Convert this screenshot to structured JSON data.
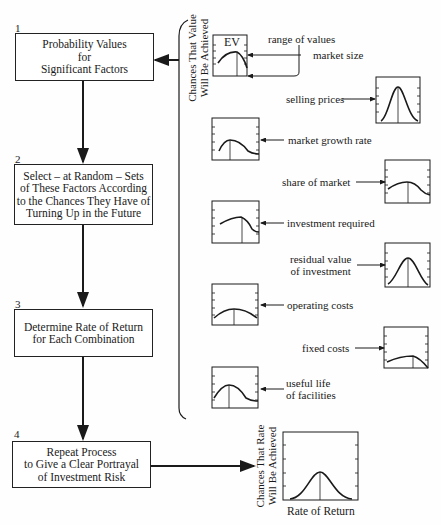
{
  "steps": [
    {
      "number": "1",
      "text": "Probability Values\nfor\nSignificant Factors"
    },
    {
      "number": "2",
      "text": "Select – at Random – Sets\nof These Factors According\nto the Chances They Have of\nTurning Up in the Future"
    },
    {
      "number": "3",
      "text": "Determine Rate of Return\nfor Each Combination"
    },
    {
      "number": "4",
      "text": "Repeat Process\nto Give a Clear Portrayal\nof Investment Risk"
    }
  ],
  "factor_axis_label": "Chances That Value\nWill Be Achieved",
  "ev_label": "EV",
  "range_label": "range of values",
  "factors": [
    {
      "name": "market size",
      "curve": "broad-skewed-right"
    },
    {
      "name": "selling prices",
      "curve": "narrow-normal"
    },
    {
      "name": "market growth rate",
      "curve": "skewed-left-peak"
    },
    {
      "name": "share of market",
      "curve": "broad-skewed-left"
    },
    {
      "name": "investment required",
      "curve": "broad-peak-right"
    },
    {
      "name": "residual value\nof investment",
      "curve": "normal"
    },
    {
      "name": "operating costs",
      "curve": "flat-broad"
    },
    {
      "name": "fixed costs",
      "curve": "flat-peak-right"
    },
    {
      "name": "useful life\nof facilities",
      "curve": "skewed-left-peak"
    }
  ],
  "result_chart": {
    "ylabel": "Chances That Rate\nWill Be Achieved",
    "xlabel": "Rate of Return",
    "curve": "normal"
  },
  "colors": {
    "ink": "#1a1a1a",
    "background": "#fefefe"
  }
}
